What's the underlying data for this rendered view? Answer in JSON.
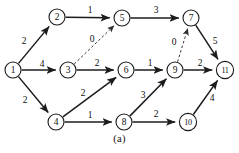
{
  "figure": {
    "caption": "(a)",
    "kind": "directed-weighted-graph",
    "background_color": "#ffffff",
    "stroke_color": "#1c1c1c",
    "dashed_stroke_color": "#3a3a3a"
  },
  "graph": {
    "nodes": [
      {
        "id": "1",
        "label": "1",
        "x": 13,
        "y": 70,
        "r": 8
      },
      {
        "id": "2",
        "label": "2",
        "x": 57,
        "y": 17,
        "r": 8
      },
      {
        "id": "3",
        "label": "3",
        "x": 68,
        "y": 70,
        "r": 8
      },
      {
        "id": "4",
        "label": "4",
        "x": 56,
        "y": 122,
        "r": 8
      },
      {
        "id": "5",
        "label": "5",
        "x": 122,
        "y": 18,
        "r": 8
      },
      {
        "id": "6",
        "label": "6",
        "x": 126,
        "y": 70,
        "r": 8
      },
      {
        "id": "7",
        "label": "7",
        "x": 191,
        "y": 18,
        "r": 8
      },
      {
        "id": "8",
        "label": "8",
        "x": 124,
        "y": 122,
        "r": 8
      },
      {
        "id": "9",
        "label": "9",
        "x": 175,
        "y": 70,
        "r": 8
      },
      {
        "id": "10",
        "label": "10",
        "x": 188,
        "y": 122,
        "r": 8.6
      },
      {
        "id": "11",
        "label": "11",
        "x": 225,
        "y": 70,
        "r": 8.6
      }
    ],
    "edges": [
      {
        "from": "1",
        "to": "2",
        "weight": "2",
        "style": "solid",
        "lx": 24,
        "ly": 41
      },
      {
        "from": "1",
        "to": "3",
        "weight": "4",
        "style": "solid",
        "lx": 42,
        "ly": 64
      },
      {
        "from": "1",
        "to": "4",
        "weight": "2",
        "style": "solid",
        "lx": 25,
        "ly": 100
      },
      {
        "from": "2",
        "to": "5",
        "weight": "1",
        "style": "solid",
        "lx": 90,
        "ly": 10
      },
      {
        "from": "3",
        "to": "5",
        "weight": "0",
        "style": "dashed",
        "lx": 92,
        "ly": 39
      },
      {
        "from": "3",
        "to": "6",
        "weight": "2",
        "style": "solid",
        "lx": 97,
        "ly": 63
      },
      {
        "from": "4",
        "to": "6",
        "weight": "2",
        "style": "solid",
        "lx": 83,
        "ly": 93
      },
      {
        "from": "4",
        "to": "8",
        "weight": "1",
        "style": "solid",
        "lx": 90,
        "ly": 115
      },
      {
        "from": "5",
        "to": "7",
        "weight": "3",
        "style": "solid",
        "lx": 156,
        "ly": 10
      },
      {
        "from": "6",
        "to": "9",
        "weight": "1",
        "style": "solid",
        "lx": 150,
        "ly": 63
      },
      {
        "from": "7",
        "to": "11",
        "weight": "5",
        "style": "solid",
        "lx": 215,
        "ly": 41
      },
      {
        "from": "8",
        "to": "9",
        "weight": "3",
        "style": "solid",
        "lx": 143,
        "ly": 95
      },
      {
        "from": "8",
        "to": "10",
        "weight": "2",
        "style": "solid",
        "lx": 156,
        "ly": 114
      },
      {
        "from": "9",
        "to": "7",
        "weight": "0",
        "style": "dashed",
        "lx": 174,
        "ly": 42
      },
      {
        "from": "9",
        "to": "11",
        "weight": "2",
        "style": "solid",
        "lx": 200,
        "ly": 63
      },
      {
        "from": "10",
        "to": "11",
        "weight": "4",
        "style": "solid",
        "lx": 212,
        "ly": 98
      }
    ]
  }
}
